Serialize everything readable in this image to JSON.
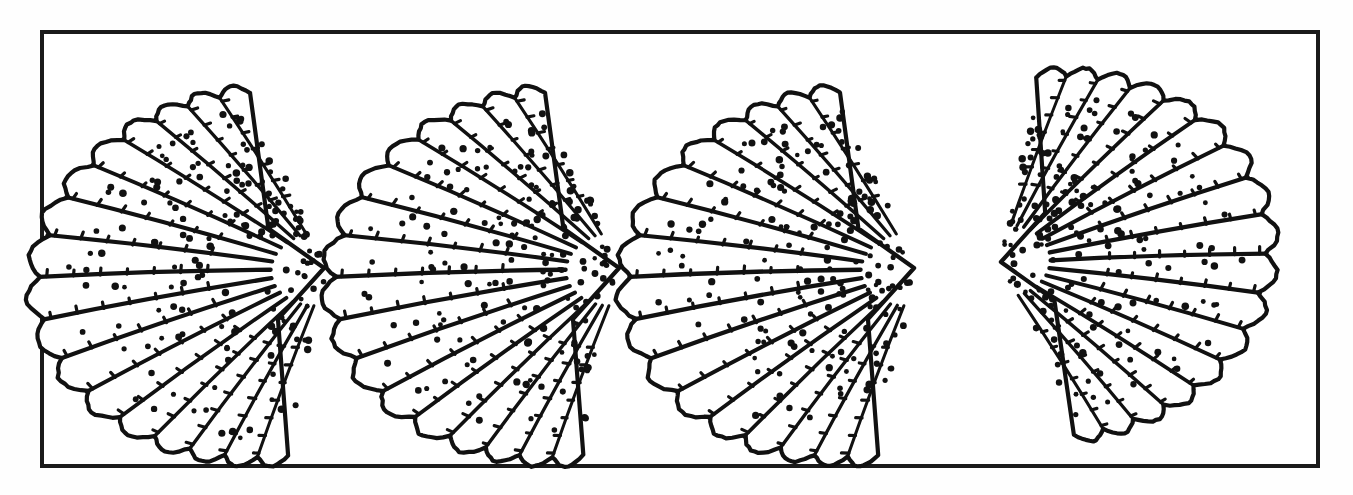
{
  "figure": {
    "kind": "line-illustration",
    "title": "",
    "caption": "",
    "background_color": "#fefefe",
    "ink_color": "#111111",
    "frame": {
      "name": "figure-border",
      "x": 42,
      "y": 32,
      "width": 1276,
      "height": 434,
      "stroke_color": "#1a1a1a",
      "stroke_width": 4,
      "fill_color": "#ffffff"
    },
    "canvas": {
      "width": 1353,
      "height": 495
    },
    "specimen_count": 4,
    "specimens": [
      {
        "id": "shell-1",
        "label": "",
        "center_x": 213,
        "center_y": 252,
        "radius_x": 150,
        "radius_y": 160,
        "hinge_side": "right",
        "hinge_x": 328,
        "hinge_y": 268,
        "rib_count": 17,
        "rotation_deg": -6,
        "dots": true
      },
      {
        "id": "shell-2",
        "label": "",
        "center_x": 508,
        "center_y": 252,
        "radius_x": 150,
        "radius_y": 160,
        "hinge_side": "right",
        "hinge_x": 623,
        "hinge_y": 268,
        "rib_count": 17,
        "rotation_deg": -6,
        "dots": true
      },
      {
        "id": "shell-3",
        "label": "",
        "center_x": 803,
        "center_y": 252,
        "radius_x": 150,
        "radius_y": 160,
        "hinge_side": "right",
        "hinge_x": 918,
        "hinge_y": 268,
        "rib_count": 17,
        "rotation_deg": -6,
        "dots": true
      },
      {
        "id": "shell-4",
        "label": "",
        "center_x": 1113,
        "center_y": 265,
        "radius_x": 140,
        "radius_y": 158,
        "hinge_side": "left",
        "hinge_x": 997,
        "hinge_y": 262,
        "rib_count": 17,
        "rotation_deg": 6,
        "dots": true
      }
    ]
  }
}
